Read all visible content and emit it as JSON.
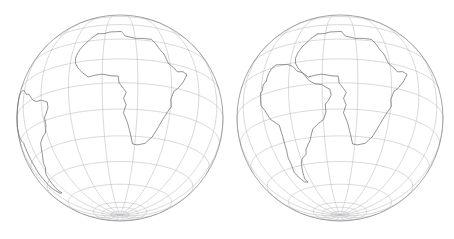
{
  "figure": {
    "background_color": "#ffffff",
    "width": 454,
    "height": 239
  },
  "style": {
    "graticule_color": "#b9b9bd",
    "limb_color": "#8e8e93",
    "coast_color": "#6a6a70",
    "graticule_width": 0.55,
    "limb_width": 0.8,
    "coast_width": 0.75
  },
  "chart_data": {
    "type": "map",
    "projection": "orthographic",
    "title": "",
    "panels": [
      {
        "name": "present-day-globe",
        "label": "",
        "center": {
          "x": 120,
          "y": 118
        },
        "radius": 103,
        "rotation": {
          "lon": 10,
          "lat": -20,
          "roll": 0
        },
        "graticule": {
          "meridian_step_deg": 20,
          "parallel_step_deg": 15,
          "visible": true
        },
        "features": [
          "south-america",
          "africa"
        ],
        "arrangement": "present-day"
      },
      {
        "name": "reconstruction-globe",
        "label": "",
        "center": {
          "x": 340,
          "y": 118
        },
        "radius": 103,
        "rotation": {
          "lon": 10,
          "lat": -20,
          "roll": 0
        },
        "graticule": {
          "meridian_step_deg": 20,
          "parallel_step_deg": 15,
          "visible": true
        },
        "features": [
          "south-america-fitted",
          "africa"
        ],
        "arrangement": "pangaea-fit"
      }
    ],
    "coastlines": {
      "africa_lonlat": [
        [
          -5.4,
          35.8
        ],
        [
          -1.0,
          35.5
        ],
        [
          3.0,
          36.8
        ],
        [
          8.5,
          37.0
        ],
        [
          11.0,
          37.2
        ],
        [
          13.5,
          32.8
        ],
        [
          20.0,
          31.0
        ],
        [
          25.0,
          31.5
        ],
        [
          31.0,
          31.5
        ],
        [
          33.0,
          28.5
        ],
        [
          35.0,
          24.0
        ],
        [
          37.2,
          21.0
        ],
        [
          39.0,
          15.0
        ],
        [
          43.0,
          12.0
        ],
        [
          44.5,
          10.5
        ],
        [
          48.5,
          11.5
        ],
        [
          51.4,
          10.4
        ],
        [
          48.0,
          5.0
        ],
        [
          44.0,
          0.0
        ],
        [
          41.5,
          -2.0
        ],
        [
          39.8,
          -7.0
        ],
        [
          40.5,
          -11.0
        ],
        [
          38.0,
          -15.0
        ],
        [
          35.5,
          -20.0
        ],
        [
          33.0,
          -25.5
        ],
        [
          31.0,
          -29.5
        ],
        [
          27.0,
          -33.5
        ],
        [
          22.0,
          -34.8
        ],
        [
          18.5,
          -34.4
        ],
        [
          17.0,
          -30.0
        ],
        [
          14.5,
          -22.5
        ],
        [
          12.0,
          -17.0
        ],
        [
          13.5,
          -12.5
        ],
        [
          12.0,
          -9.0
        ],
        [
          13.5,
          -5.5
        ],
        [
          9.5,
          0.0
        ],
        [
          9.0,
          4.0
        ],
        [
          5.5,
          4.2
        ],
        [
          0.0,
          5.5
        ],
        [
          -4.0,
          5.2
        ],
        [
          -8.0,
          4.5
        ],
        [
          -11.5,
          7.5
        ],
        [
          -14.5,
          11.0
        ],
        [
          -16.5,
          14.5
        ],
        [
          -17.0,
          18.0
        ],
        [
          -16.0,
          22.0
        ],
        [
          -14.0,
          26.0
        ],
        [
          -11.0,
          29.5
        ],
        [
          -9.5,
          32.0
        ],
        [
          -5.4,
          35.8
        ]
      ],
      "south_america_lonlat": [
        [
          -81.2,
          -4.5
        ],
        [
          -80.0,
          -3.5
        ],
        [
          -79.8,
          0.0
        ],
        [
          -77.5,
          2.0
        ],
        [
          -77.0,
          6.0
        ],
        [
          -75.5,
          9.5
        ],
        [
          -72.5,
          11.8
        ],
        [
          -68.5,
          11.2
        ],
        [
          -63.5,
          10.5
        ],
        [
          -61.0,
          9.5
        ],
        [
          -59.0,
          8.3
        ],
        [
          -56.0,
          5.5
        ],
        [
          -52.5,
          4.5
        ],
        [
          -50.0,
          1.8
        ],
        [
          -47.5,
          -0.8
        ],
        [
          -44.0,
          -2.5
        ],
        [
          -40.0,
          -2.8
        ],
        [
          -35.2,
          -5.2
        ],
        [
          -35.0,
          -8.5
        ],
        [
          -37.0,
          -11.5
        ],
        [
          -38.8,
          -13.0
        ],
        [
          -39.0,
          -17.5
        ],
        [
          -41.0,
          -21.5
        ],
        [
          -44.5,
          -23.0
        ],
        [
          -48.5,
          -25.5
        ],
        [
          -52.0,
          -31.5
        ],
        [
          -56.5,
          -36.0
        ],
        [
          -57.5,
          -38.5
        ],
        [
          -62.0,
          -40.5
        ],
        [
          -64.0,
          -42.5
        ],
        [
          -65.5,
          -45.0
        ],
        [
          -67.5,
          -49.0
        ],
        [
          -69.0,
          -52.5
        ],
        [
          -68.0,
          -54.9
        ],
        [
          -71.5,
          -54.0
        ],
        [
          -74.0,
          -50.0
        ],
        [
          -75.0,
          -46.5
        ],
        [
          -73.5,
          -42.0
        ],
        [
          -73.0,
          -37.0
        ],
        [
          -71.5,
          -33.0
        ],
        [
          -70.5,
          -25.0
        ],
        [
          -70.5,
          -18.5
        ],
        [
          -76.0,
          -14.0
        ],
        [
          -79.0,
          -8.0
        ],
        [
          -81.2,
          -4.5
        ]
      ],
      "south_america_fitted_lonlat": [
        [
          -40.5,
          1.5
        ],
        [
          -39.0,
          2.5
        ],
        [
          -38.6,
          5.8
        ],
        [
          -36.2,
          7.6
        ],
        [
          -35.4,
          11.4
        ],
        [
          -33.6,
          14.6
        ],
        [
          -30.4,
          16.4
        ],
        [
          -26.4,
          15.6
        ],
        [
          -21.6,
          14.6
        ],
        [
          -19.2,
          13.4
        ],
        [
          -17.4,
          12.0
        ],
        [
          -14.8,
          9.0
        ],
        [
          -11.6,
          7.6
        ],
        [
          -9.4,
          4.8
        ],
        [
          -7.2,
          2.0
        ],
        [
          -4.0,
          0.0
        ],
        [
          -0.2,
          -0.8
        ],
        [
          4.4,
          -3.8
        ],
        [
          5.0,
          -7.2
        ],
        [
          3.2,
          -10.4
        ],
        [
          1.6,
          -12.0
        ],
        [
          1.8,
          -16.5
        ],
        [
          0.2,
          -20.6
        ],
        [
          -3.2,
          -22.6
        ],
        [
          -7.0,
          -25.4
        ],
        [
          -10.0,
          -31.6
        ],
        [
          -14.2,
          -36.4
        ],
        [
          -15.0,
          -39.0
        ],
        [
          -19.4,
          -41.4
        ],
        [
          -21.2,
          -43.6
        ],
        [
          -22.4,
          -46.2
        ],
        [
          -24.0,
          -50.3
        ],
        [
          -25.2,
          -53.8
        ],
        [
          -24.0,
          -56.2
        ],
        [
          -27.6,
          -55.4
        ],
        [
          -30.4,
          -51.5
        ],
        [
          -31.6,
          -48.0
        ],
        [
          -30.4,
          -43.5
        ],
        [
          -30.2,
          -38.5
        ],
        [
          -29.0,
          -34.5
        ],
        [
          -28.4,
          -26.5
        ],
        [
          -28.8,
          -20.0
        ],
        [
          -34.4,
          -15.4
        ],
        [
          -37.8,
          -9.4
        ],
        [
          -40.5,
          -5.8
        ],
        [
          -40.5,
          1.5
        ]
      ]
    }
  }
}
